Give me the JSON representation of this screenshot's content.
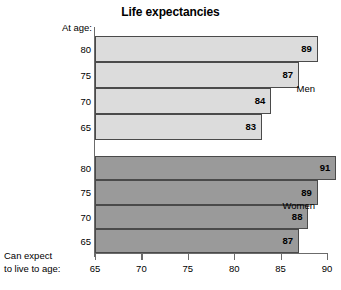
{
  "chart_data": {
    "type": "bar",
    "orientation": "horizontal",
    "title": "Life expectancies",
    "xlabel": "Can expect to live to age:",
    "ylabel": "At age:",
    "xlim": [
      65,
      90
    ],
    "xticks": [
      65,
      70,
      75,
      80,
      85,
      90
    ],
    "grid": false,
    "legend": "none",
    "groups": [
      {
        "name": "Men",
        "color": "#dcdcdc",
        "categories": [
          "80",
          "75",
          "70",
          "65"
        ],
        "values": [
          89,
          87,
          84,
          83
        ]
      },
      {
        "name": "Women",
        "color": "#9a9a9a",
        "categories": [
          "80",
          "75",
          "70",
          "65"
        ],
        "values": [
          91,
          89,
          88,
          87
        ]
      }
    ]
  },
  "labels": {
    "title": "Life expectancies",
    "at_age": "At age:",
    "bottom_caption_line1": "Can expect",
    "bottom_caption_line2": "to live to age:"
  },
  "colors": {
    "men_bar": "#dcdcdc",
    "women_bar": "#9a9a9a",
    "bar_border": "#4a4a4a",
    "axis": "#6b6b6b",
    "text": "#000000",
    "background": "#ffffff"
  }
}
